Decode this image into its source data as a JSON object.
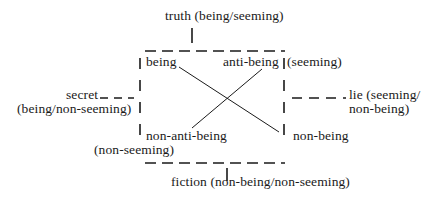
{
  "diagram": {
    "type": "semiotic-square",
    "nodes": {
      "top": {
        "label": "truth (being/seeming)"
      },
      "bottom": {
        "label": "fiction (non-being/non-seeming)"
      },
      "left": {
        "line1": "secret",
        "line2": "(being/non-seeming)"
      },
      "right": {
        "line1": "lie (seeming/",
        "line2": "non-being)"
      },
      "corner_top_left": {
        "label": "being"
      },
      "corner_top_right": {
        "label": "anti-being",
        "note": "(seeming)"
      },
      "corner_bottom_left": {
        "label": "non-anti-being",
        "note": "(non-seeming)"
      },
      "corner_bottom_right": {
        "label": "non-being"
      }
    },
    "edges": [
      {
        "from": "being",
        "to": "non-being",
        "style": "solid"
      },
      {
        "from": "anti-being",
        "to": "non-anti-being",
        "style": "solid"
      },
      {
        "from": "being",
        "to": "anti-being",
        "style": "dashed",
        "joins": "truth"
      },
      {
        "from": "non-anti-being",
        "to": "non-being",
        "style": "dashed",
        "joins": "fiction"
      },
      {
        "from": "being",
        "to": "non-anti-being",
        "style": "dashed",
        "joins": "secret"
      },
      {
        "from": "anti-being",
        "to": "non-being",
        "style": "dashed",
        "joins": "lie"
      }
    ],
    "colors": {
      "ink": "#1a1a1a",
      "background": "#ffffff"
    }
  }
}
